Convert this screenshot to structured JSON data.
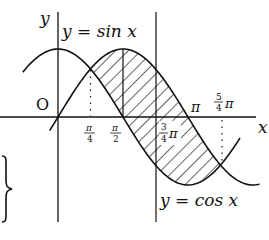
{
  "figure": {
    "axis_labels": {
      "x": "x",
      "y": "y",
      "origin": "O"
    },
    "curve_labels": {
      "sin": "y = sin x",
      "cos": "y = cos x"
    },
    "tick_labels": {
      "pi_over_4": {
        "num": "π",
        "den": "4"
      },
      "pi_over_2": {
        "num": "π",
        "den": "2"
      },
      "three_pi_over_4": {
        "num": "3",
        "den": "4",
        "suffix": "π"
      },
      "pi": "π",
      "five_pi_over_4": {
        "num": "5",
        "den": "4",
        "suffix": "π"
      }
    },
    "brace": "}",
    "colors": {
      "stroke": "#111111",
      "background": "#ffffff"
    }
  }
}
